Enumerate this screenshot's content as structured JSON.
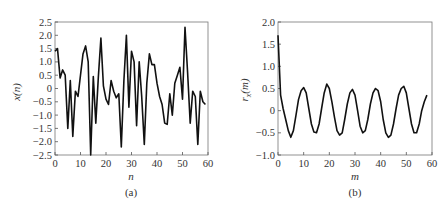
{
  "chart_data": [
    {
      "type": "line",
      "panel": "(a)",
      "title": "",
      "xlabel": "n",
      "ylabel": "x(n)",
      "xlim": [
        0,
        60
      ],
      "ylim": [
        -2.5,
        2.5
      ],
      "xticks": [
        "0",
        "10",
        "20",
        "30",
        "40",
        "50",
        "60"
      ],
      "yticks": [
        "2.5",
        "2.0",
        "1.5",
        "1.0",
        "0.5",
        "0",
        "-0.5",
        "-1.0",
        "-1.5",
        "-2.0",
        "-2.5"
      ],
      "grid": false,
      "x": [
        0,
        1,
        2,
        3,
        4,
        5,
        6,
        7,
        8,
        9,
        10,
        11,
        12,
        13,
        14,
        15,
        16,
        17,
        18,
        19,
        20,
        21,
        22,
        23,
        24,
        25,
        26,
        27,
        28,
        29,
        30,
        31,
        32,
        33,
        34,
        35,
        36,
        37,
        38,
        39,
        40,
        41,
        42,
        43,
        44,
        45,
        46,
        47,
        48,
        49,
        50,
        51,
        52,
        53,
        54,
        55,
        56,
        57,
        58,
        59
      ],
      "values": [
        1.4,
        1.5,
        0.4,
        0.7,
        0.5,
        -1.5,
        0.3,
        -1.8,
        -0.1,
        -0.3,
        0.5,
        1.3,
        1.6,
        1.0,
        -2.5,
        0.45,
        -1.3,
        0.4,
        1.9,
        0.1,
        -0.4,
        -0.6,
        0.3,
        -0.1,
        -0.35,
        -0.2,
        -2.2,
        0.3,
        2.0,
        -0.7,
        1.4,
        1.0,
        -1.4,
        1.0,
        -0.3,
        -2.1,
        0.2,
        1.3,
        0.9,
        0.9,
        0.2,
        -0.3,
        -0.6,
        -1.3,
        -1.35,
        -0.2,
        -1.0,
        0.2,
        0.5,
        0.8,
        -0.4,
        2.3,
        0.6,
        -1.3,
        -0.1,
        -0.3,
        -2.1,
        -0.1,
        -0.5,
        -0.6
      ]
    },
    {
      "type": "line",
      "panel": "(b)",
      "title": "",
      "xlabel": "m",
      "ylabel": "r_x(m)",
      "xlim": [
        0,
        60
      ],
      "ylim": [
        -1.0,
        2.0
      ],
      "xticks": [
        "0",
        "10",
        "20",
        "30",
        "40",
        "50",
        "60"
      ],
      "yticks": [
        "2.0",
        "1.5",
        "1.0",
        "0.5",
        "0",
        "-0.5",
        "-1.0"
      ],
      "grid": false,
      "x": [
        0,
        1,
        2,
        3,
        4,
        5,
        6,
        7,
        8,
        9,
        10,
        11,
        12,
        13,
        14,
        15,
        16,
        17,
        18,
        19,
        20,
        21,
        22,
        23,
        24,
        25,
        26,
        27,
        28,
        29,
        30,
        31,
        32,
        33,
        34,
        35,
        36,
        37,
        38,
        39,
        40,
        41,
        42,
        43,
        44,
        45,
        46,
        47,
        48,
        49,
        50,
        51,
        52,
        53,
        54,
        55,
        56,
        57,
        58
      ],
      "values": [
        1.7,
        0.35,
        0.05,
        -0.2,
        -0.45,
        -0.6,
        -0.45,
        -0.1,
        0.25,
        0.45,
        0.52,
        0.4,
        0.05,
        -0.3,
        -0.48,
        -0.5,
        -0.3,
        0.05,
        0.4,
        0.6,
        0.5,
        0.2,
        -0.15,
        -0.45,
        -0.55,
        -0.5,
        -0.2,
        0.15,
        0.4,
        0.48,
        0.35,
        0.0,
        -0.35,
        -0.5,
        -0.45,
        -0.2,
        0.15,
        0.4,
        0.5,
        0.45,
        0.2,
        -0.2,
        -0.5,
        -0.6,
        -0.55,
        -0.3,
        0.05,
        0.35,
        0.5,
        0.55,
        0.4,
        0.05,
        -0.3,
        -0.5,
        -0.5,
        -0.3,
        0.0,
        0.2,
        0.35
      ]
    }
  ],
  "panels": {
    "a": {
      "xlabel": "n",
      "ylabel": "x(n)",
      "caption": "(a)"
    },
    "b": {
      "xlabel": "m",
      "ylabel": "r",
      "ylabel_sub": "x",
      "ylabel_rest": "(m)",
      "caption": "(b)"
    }
  }
}
